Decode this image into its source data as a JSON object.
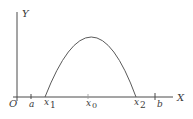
{
  "diagram": {
    "axes": {
      "x_label": "X",
      "y_label": "Y",
      "origin_label": "O"
    },
    "ticks": [
      {
        "label": "a",
        "subscript": ""
      },
      {
        "label": "x",
        "subscript": "1"
      },
      {
        "label": "x",
        "subscript": "0"
      },
      {
        "label": "x",
        "subscript": "2"
      },
      {
        "label": "b",
        "subscript": ""
      }
    ],
    "curve": {
      "description": "downward parabola crossing X axis at x1 and x2 with maximum at x0",
      "color": "#5a5a5a"
    },
    "colors": {
      "axis": "#4a4a4a",
      "text": "#3a3a3a"
    }
  }
}
